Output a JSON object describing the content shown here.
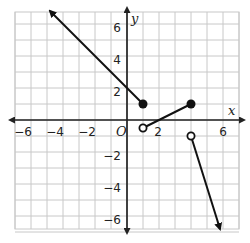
{
  "chart_data": {
    "type": "line",
    "title": "",
    "xlabel": "x",
    "ylabel": "y",
    "origin_label": "O",
    "xlim": [
      -7,
      7
    ],
    "ylim": [
      -7,
      7
    ],
    "grid": true,
    "x_ticks": [
      -6,
      -4,
      -2,
      2,
      6
    ],
    "y_ticks": [
      6,
      4,
      2,
      -2,
      -4,
      -6
    ],
    "x_tick_labels": [
      "−6",
      "−4",
      "−2",
      "2",
      "6"
    ],
    "y_tick_labels": [
      "6",
      "4",
      "2",
      "−2",
      "−4",
      "−6"
    ],
    "series": [
      {
        "name": "piece-1-ray",
        "points": [
          [
            1,
            1
          ],
          [
            -4.8,
            6.8
          ]
        ],
        "endpoint": "closed",
        "arrow": "end",
        "x_range": "x <= 1"
      },
      {
        "name": "piece-2-segment",
        "points": [
          [
            1,
            -0.5
          ],
          [
            4,
            1
          ]
        ],
        "start": "open",
        "end": "closed",
        "x_range": "1 < x <= 4"
      },
      {
        "name": "piece-3-ray",
        "points": [
          [
            4,
            -1
          ],
          [
            5.8,
            -6.8
          ]
        ],
        "start": "open",
        "arrow": "end",
        "x_range": "x > 4"
      }
    ],
    "markers": [
      {
        "x": 1,
        "y": 1,
        "style": "closed"
      },
      {
        "x": 4,
        "y": 1,
        "style": "closed"
      },
      {
        "x": 1,
        "y": -0.5,
        "style": "open"
      },
      {
        "x": 4,
        "y": -1,
        "style": "open"
      }
    ]
  },
  "colors": {
    "grid": "#c8c8c8",
    "axis": "#222222",
    "curve": "#111111"
  }
}
